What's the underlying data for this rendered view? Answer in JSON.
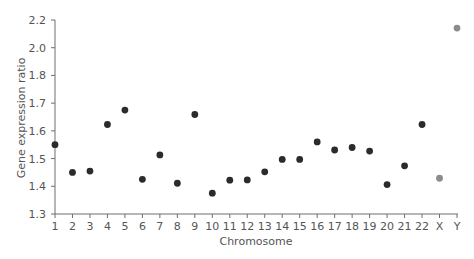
{
  "chart_data": {
    "type": "scatter",
    "title": "",
    "xlabel": "Chromosome",
    "ylabel": "Gene expression ratio",
    "categories": [
      "1",
      "2",
      "3",
      "4",
      "5",
      "6",
      "7",
      "8",
      "9",
      "10",
      "11",
      "12",
      "13",
      "14",
      "15",
      "16",
      "17",
      "18",
      "19",
      "20",
      "21",
      "22",
      "X",
      "Y"
    ],
    "values": [
      1.55,
      1.45,
      1.455,
      1.623,
      1.675,
      1.425,
      1.513,
      1.411,
      1.659,
      1.375,
      1.422,
      1.423,
      1.452,
      1.497,
      1.497,
      1.56,
      1.531,
      1.54,
      1.527,
      1.406,
      1.474,
      1.623,
      1.429,
      2.142
    ],
    "point_colors": [
      "#2b2b2b",
      "#2b2b2b",
      "#2b2b2b",
      "#2b2b2b",
      "#2b2b2b",
      "#2b2b2b",
      "#2b2b2b",
      "#2b2b2b",
      "#2b2b2b",
      "#2b2b2b",
      "#2b2b2b",
      "#2b2b2b",
      "#2b2b2b",
      "#2b2b2b",
      "#2b2b2b",
      "#2b2b2b",
      "#2b2b2b",
      "#2b2b2b",
      "#2b2b2b",
      "#2b2b2b",
      "#2b2b2b",
      "#2b2b2b",
      "#8c8c8c",
      "#8c8c8c"
    ],
    "y_ticks": [
      1.3,
      1.4,
      1.5,
      1.6,
      1.7,
      1.8,
      2.0,
      2.2
    ],
    "y_tick_labels": [
      "1.3",
      "1.4",
      "1.5",
      "1.6",
      "1.7",
      "1.8",
      "2.0",
      "2.2"
    ],
    "y_scale_note": "axis ticks are evenly spaced but labels are non-uniform (1.8 to 2.0 to 2.2 steps of 0.2)",
    "ylim": [
      1.3,
      2.2
    ],
    "grid": false,
    "legend": null,
    "colors": {
      "autosome": "#2b2b2b",
      "sex_chromosome": "#8c8c8c",
      "axis": "#6e6e6e",
      "text": "#555555"
    }
  }
}
